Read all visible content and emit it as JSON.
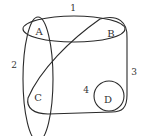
{
  "diagram": {
    "type": "hypergraph",
    "vertices": [
      {
        "id": "A",
        "label": "A",
        "x": 39,
        "y": 31
      },
      {
        "id": "B",
        "label": "B",
        "x": 111,
        "y": 33
      },
      {
        "id": "C",
        "label": "C",
        "x": 38,
        "y": 97
      },
      {
        "id": "D",
        "label": "D",
        "x": 108,
        "y": 99
      }
    ],
    "hyperedges": [
      {
        "id": "1",
        "label": "1",
        "members": [
          "A",
          "B"
        ],
        "label_x": 73,
        "label_y": 8
      },
      {
        "id": "2",
        "label": "2",
        "members": [
          "A",
          "C"
        ],
        "label_x": 14,
        "label_y": 66
      },
      {
        "id": "3",
        "label": "3",
        "members": [
          "B",
          "C",
          "D"
        ],
        "label_x": 134,
        "label_y": 73
      },
      {
        "id": "4",
        "label": "4",
        "members": [
          "D"
        ],
        "label_x": 86,
        "label_y": 91
      }
    ],
    "stroke_color": "#2a2a2a",
    "text_color": "#333333"
  }
}
